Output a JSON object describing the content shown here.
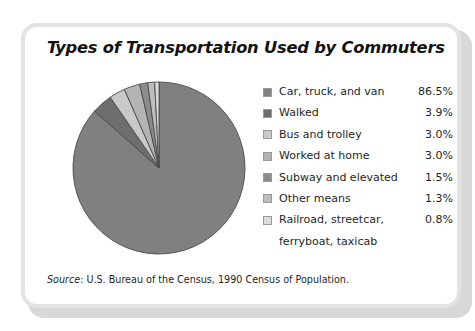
{
  "page": {
    "top_bleed_text": "..  .  ..   ...   ."
  },
  "card": {
    "title": "Types of Transportation Used by Commuters",
    "source_label": "Source",
    "source_text": ": U.S. Bureau of the Census, 1990 Census of Population."
  },
  "chart_data": {
    "type": "pie",
    "title": "Types of Transportation Used by Commuters",
    "unit": "%",
    "start_angle_deg": 0,
    "direction": "clockwise",
    "legend_position": "right",
    "grid": false,
    "categories": [
      "Car, truck, and van",
      "Walked",
      "Bus and trolley",
      "Worked at home",
      "Subway and elevated",
      "Other means",
      "Railroad, streetcar, ferryboat, taxicab"
    ],
    "values": [
      86.5,
      3.9,
      3.0,
      3.0,
      1.5,
      1.3,
      0.8
    ],
    "value_labels": [
      "86.5%",
      "3.9%",
      "3.0%",
      "3.0%",
      "1.5%",
      "1.3%",
      "0.8%"
    ],
    "colors": [
      "#808080",
      "#6e6e6e",
      "#c9c9c9",
      "#b4b4b4",
      "#8c8c8c",
      "#bdbdbd",
      "#dcdcdc"
    ],
    "slice_border_color": "#4a4a4a"
  },
  "legend": {
    "items": [
      {
        "label": "Car, truck, and van",
        "value": "86.5%",
        "color": "#808080",
        "label2": ""
      },
      {
        "label": "Walked",
        "value": "3.9%",
        "color": "#6e6e6e",
        "label2": ""
      },
      {
        "label": "Bus and trolley",
        "value": "3.0%",
        "color": "#c9c9c9",
        "label2": ""
      },
      {
        "label": "Worked at home",
        "value": "3.0%",
        "color": "#b4b4b4",
        "label2": ""
      },
      {
        "label": "Subway and elevated",
        "value": "1.5%",
        "color": "#8c8c8c",
        "label2": ""
      },
      {
        "label": "Other means",
        "value": "1.3%",
        "color": "#bdbdbd",
        "label2": ""
      },
      {
        "label": "Railroad, streetcar,",
        "value": "0.8%",
        "color": "#dcdcdc",
        "label2": "ferryboat, taxicab"
      }
    ]
  }
}
